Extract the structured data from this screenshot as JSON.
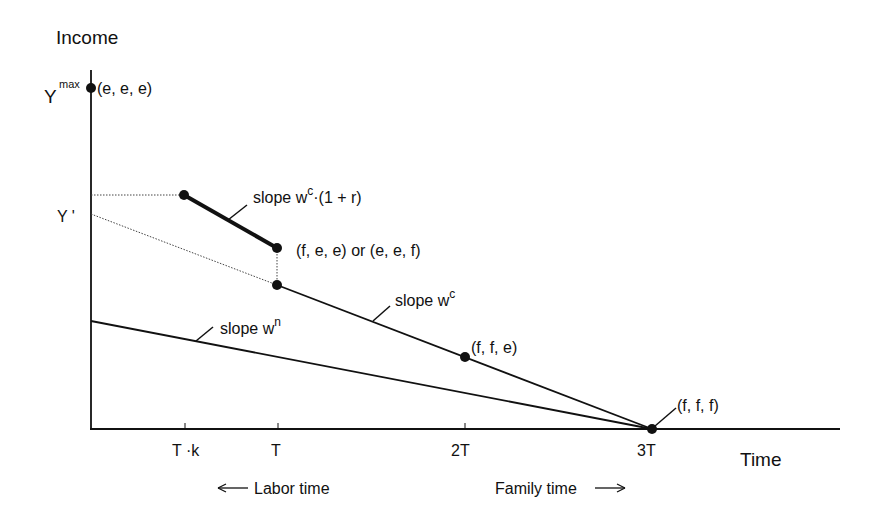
{
  "diagram": {
    "y_axis_label": "Income",
    "x_axis_label": "Time",
    "y_labels": {
      "ymax_base": "Y",
      "ymax_sup": "max",
      "yprime": "Y '"
    },
    "x_ticks": [
      "T ·k",
      "T",
      "2T",
      "3T"
    ],
    "points": {
      "eee": "(e, e, e)",
      "fee_eef": "(f, e, e) or (e, e, f)",
      "ffe": "(f, f, e)",
      "fff": "(f, f, f)"
    },
    "slopes": {
      "wc_r_prefix": "slope w",
      "wc_r_sup": "c",
      "wc_r_suffix": "·(1 + r)",
      "wc_prefix": "slope w",
      "wc_sup": "c",
      "wn_prefix": "slope w",
      "wn_sup": "n"
    },
    "arrows": {
      "labor": "Labor time",
      "family": "Family time"
    },
    "colors": {
      "line": "#111111",
      "background": "#ffffff",
      "dotted": "#444444"
    }
  }
}
